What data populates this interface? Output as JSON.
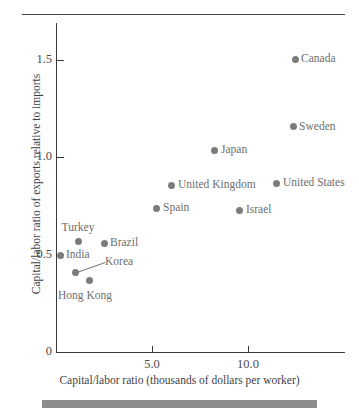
{
  "chart_data": {
    "type": "scatter",
    "title": "",
    "xlabel": "Capital/labor ratio (thousands of dollars per worker)",
    "ylabel": "Capital/labor ratio of exports relative to imports",
    "xlim": [
      0,
      15.05
    ],
    "ylim": [
      0,
      1.7
    ],
    "xticks": [
      "5.0",
      "10.0"
    ],
    "xtick_values": [
      5.0,
      10.0
    ],
    "yticks": [
      "0",
      "0.5",
      "1.0",
      "1.5"
    ],
    "ytick_values": [
      0,
      0.5,
      1.0,
      1.5
    ],
    "grid": false,
    "legend": "none",
    "marker_color": "#7b7b7b",
    "points": [
      {
        "label": "Canada",
        "x": 12.45,
        "y": 1.51,
        "label_pos": "right"
      },
      {
        "label": "Sweden",
        "x": 12.35,
        "y": 1.16,
        "label_pos": "right"
      },
      {
        "label": "Japan",
        "x": 8.28,
        "y": 1.04,
        "label_pos": "right"
      },
      {
        "label": "United States",
        "x": 11.51,
        "y": 0.87,
        "label_pos": "right"
      },
      {
        "label": "United Kingdom",
        "x": 6.04,
        "y": 0.86,
        "label_pos": "right"
      },
      {
        "label": "Spain",
        "x": 5.26,
        "y": 0.74,
        "label_pos": "right"
      },
      {
        "label": "Israel",
        "x": 9.58,
        "y": 0.73,
        "label_pos": "right"
      },
      {
        "label": "Turkey",
        "x": 1.15,
        "y": 0.57,
        "label_pos": "above"
      },
      {
        "label": "Brazil",
        "x": 2.5,
        "y": 0.56,
        "label_pos": "right"
      },
      {
        "label": "India",
        "x": 0.21,
        "y": 0.5,
        "label_pos": "right"
      },
      {
        "label": "Korea",
        "x": 0.99,
        "y": 0.41,
        "label_pos": "leader"
      },
      {
        "label": "Hong Kong",
        "x": 1.77,
        "y": 0.37,
        "label_pos": "below"
      }
    ]
  },
  "figure": {
    "top_rule": "rule",
    "bottom_bar": "gray-bar"
  }
}
